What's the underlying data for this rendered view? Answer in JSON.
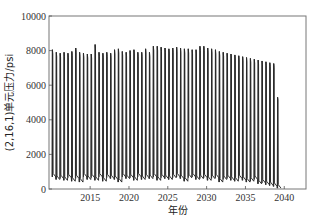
{
  "chart_data": {
    "type": "line",
    "title": "",
    "xlabel": "年份",
    "ylabel": "(2,16,1)单元压力/psi",
    "xlim": [
      2009.7,
      2042.8
    ],
    "ylim": [
      0,
      10000
    ],
    "xticks": [
      2015,
      2020,
      2025,
      2030,
      2035,
      2040
    ],
    "xtick_labels": [
      "2015",
      "2020",
      "2025",
      "2030",
      "2035",
      "2040"
    ],
    "yticks": [
      0,
      2000,
      4000,
      6000,
      8000,
      10000
    ],
    "ytick_labels": [
      "0",
      "2000",
      "4000",
      "6000",
      "8000",
      "10000"
    ],
    "grid": false,
    "legend": null,
    "series": [
      {
        "name": "pressure",
        "color": "#1a1a1a",
        "description": "Semi-annual cyclic injection/production pressure: rapid rise to peak then drop to trough",
        "cycle_start_year": 2010.1,
        "cycle_period_years": 0.5,
        "peaks": [
          8050,
          7900,
          7850,
          7900,
          7850,
          7950,
          8150,
          7900,
          7850,
          7800,
          7800,
          8350,
          7900,
          7850,
          7900,
          7850,
          8050,
          8100,
          7950,
          7900,
          8000,
          8050,
          7900,
          7900,
          8100,
          7900,
          8250,
          8250,
          8200,
          8150,
          8100,
          8150,
          8200,
          8150,
          8100,
          8100,
          8050,
          8050,
          8250,
          8250,
          8150,
          8100,
          8050,
          7950,
          7900,
          7850,
          7800,
          7750,
          7700,
          7650,
          7600,
          7550,
          7500,
          7450,
          7400,
          7350,
          7300,
          7250,
          5300
        ],
        "troughs": [
          700,
          550,
          600,
          500,
          650,
          450,
          600,
          400,
          700,
          550,
          650,
          500,
          700,
          450,
          650,
          600,
          550,
          400,
          700,
          600,
          650,
          500,
          700,
          550,
          650,
          600,
          700,
          500,
          650,
          600,
          550,
          650,
          700,
          600,
          450,
          650,
          700,
          550,
          600,
          650,
          500,
          600,
          650,
          400,
          550,
          600,
          500,
          450,
          600,
          500,
          400,
          450,
          550,
          300,
          350,
          250,
          200,
          150,
          50
        ]
      }
    ]
  }
}
